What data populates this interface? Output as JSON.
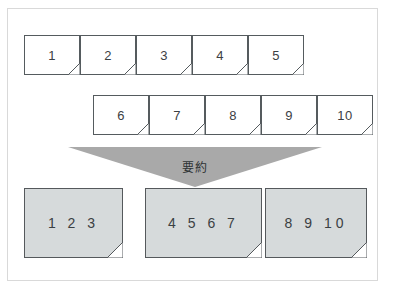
{
  "figure": {
    "type": "summarization-flow-diagram",
    "background_color": "#ffffff",
    "frame_border_color": "#d9d9d9"
  },
  "source_rows": [
    {
      "row_name": "source-row-1",
      "cards": [
        {
          "label": "1"
        },
        {
          "label": "2"
        },
        {
          "label": "3"
        },
        {
          "label": "4"
        },
        {
          "label": "5"
        }
      ]
    },
    {
      "row_name": "source-row-2",
      "cards": [
        {
          "label": "6"
        },
        {
          "label": "7"
        },
        {
          "label": "8"
        },
        {
          "label": "9"
        },
        {
          "label": "10"
        }
      ]
    }
  ],
  "arrow": {
    "label": "要約",
    "direction": "down",
    "color": "#a9a9a9"
  },
  "result_row": {
    "row_name": "summary-row",
    "card_fill_color": "#d6dadb",
    "cards": [
      {
        "label": "1  2  3"
      },
      {
        "label": "4  5  6  7"
      },
      {
        "label": "8  9  10"
      }
    ]
  }
}
